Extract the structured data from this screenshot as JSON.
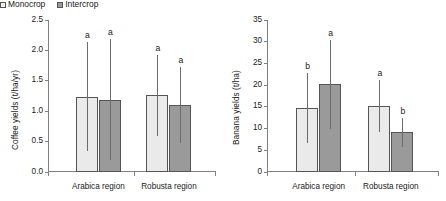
{
  "figure": {
    "legend": {
      "position": "top-left-of-left-panel",
      "entries": [
        {
          "label": "Monocrop",
          "swatch": "light-grey-square",
          "color": "#f2f2f2"
        },
        {
          "label": "Intercrop",
          "swatch": "dark-grey-square",
          "color": "#9a9a9a"
        }
      ]
    }
  },
  "chart_data": [
    {
      "type": "bar",
      "title": "",
      "xlabel": "",
      "ylabel": "Coffee yields (t/ha/yr)",
      "categories": [
        "Arabica region",
        "Robusta region"
      ],
      "ylim": [
        0.0,
        2.5
      ],
      "yticks": [
        "0.0",
        "0.5",
        "1.0",
        "1.5",
        "2.0",
        "2.5"
      ],
      "ytick_values": [
        0.0,
        0.5,
        1.0,
        1.5,
        2.0,
        2.5
      ],
      "grid": false,
      "legend_position": "top-left",
      "series": [
        {
          "name": "Monocrop",
          "color": "#eaeaea",
          "values": [
            1.24,
            1.26
          ],
          "errors": [
            0.89,
            0.66
          ],
          "annotations": [
            "a",
            "a"
          ]
        },
        {
          "name": "Intercrop",
          "color": "#9a9a9a",
          "values": [
            1.19,
            1.1
          ],
          "errors": [
            1.0,
            0.63
          ],
          "annotations": [
            "a",
            "a"
          ]
        }
      ]
    },
    {
      "type": "bar",
      "title": "",
      "xlabel": "",
      "ylabel": "Banana yields (t/ha)",
      "categories": [
        "Arabica region",
        "Robusta region"
      ],
      "ylim": [
        0,
        35
      ],
      "yticks": [
        "0",
        "5",
        "10",
        "15",
        "20",
        "25",
        "30",
        "35"
      ],
      "ytick_values": [
        0,
        5,
        10,
        15,
        20,
        25,
        30,
        35
      ],
      "grid": false,
      "legend_position": "none",
      "series": [
        {
          "name": "Monocrop",
          "color": "#eaeaea",
          "values": [
            14.8,
            15.1
          ],
          "errors": [
            8.1,
            6.0
          ],
          "annotations": [
            "b",
            "a"
          ]
        },
        {
          "name": "Intercrop",
          "color": "#9a9a9a",
          "values": [
            20.2,
            9.1
          ],
          "errors": [
            10.2,
            3.4
          ],
          "annotations": [
            "a",
            "b"
          ]
        }
      ]
    }
  ]
}
